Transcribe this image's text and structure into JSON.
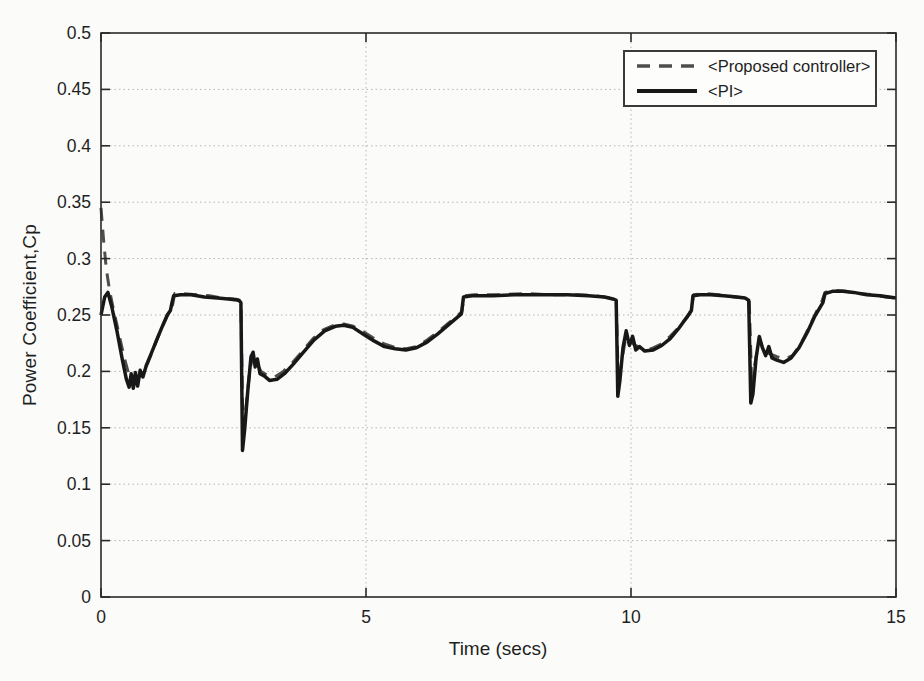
{
  "chart_data": {
    "type": "line",
    "title": "",
    "xlabel": "Time (secs)",
    "ylabel": "Power Coefficient,Cp",
    "xlim": [
      0,
      15
    ],
    "ylim": [
      0,
      0.5
    ],
    "xticks": [
      0,
      5,
      10,
      15
    ],
    "xtick_labels": [
      "0",
      "5",
      "10",
      "15"
    ],
    "yticks": [
      0,
      0.05,
      0.1,
      0.15,
      0.2,
      0.25,
      0.3,
      0.35,
      0.4,
      0.45,
      0.5
    ],
    "ytick_labels": [
      "0",
      "0.05",
      "0.1",
      "0.15",
      "0.2",
      "0.25",
      "0.3",
      "0.35",
      "0.4",
      "0.45",
      "0.5"
    ],
    "grid": true,
    "grid_style": "dotted",
    "grid_color": "#b4b4b4",
    "axis_color": "#2a2a2a",
    "legend_position": "top-right",
    "series": [
      {
        "name": "<Proposed controller>",
        "style": "dashed",
        "color": "#4d4d4d",
        "width": 3,
        "points": [
          [
            0,
            0.345
          ],
          [
            0.05,
            0.315
          ],
          [
            0.1,
            0.291
          ],
          [
            0.16,
            0.272
          ],
          [
            0.24,
            0.254
          ],
          [
            0.34,
            0.233
          ],
          [
            0.44,
            0.212
          ],
          [
            0.52,
            0.198
          ],
          [
            0.6,
            0.191
          ],
          [
            0.68,
            0.193
          ],
          [
            0.78,
            0.199
          ],
          [
            0.88,
            0.207
          ],
          [
            0.98,
            0.219
          ],
          [
            1.08,
            0.231
          ],
          [
            1.18,
            0.242
          ],
          [
            1.28,
            0.252
          ],
          [
            1.35,
            0.259
          ],
          [
            1.39,
            0.269
          ],
          [
            1.55,
            0.269
          ],
          [
            1.8,
            0.268
          ],
          [
            2.05,
            0.267
          ],
          [
            2.3,
            0.265
          ],
          [
            2.55,
            0.264
          ],
          [
            2.64,
            0.262
          ],
          [
            2.68,
            0.142
          ],
          [
            2.74,
            0.17
          ],
          [
            2.81,
            0.202
          ],
          [
            2.87,
            0.214
          ],
          [
            2.94,
            0.207
          ],
          [
            3.02,
            0.2
          ],
          [
            3.12,
            0.197
          ],
          [
            3.28,
            0.195
          ],
          [
            3.44,
            0.2
          ],
          [
            3.6,
            0.207
          ],
          [
            3.8,
            0.218
          ],
          [
            4.0,
            0.229
          ],
          [
            4.2,
            0.237
          ],
          [
            4.4,
            0.241
          ],
          [
            4.58,
            0.242
          ],
          [
            4.76,
            0.24
          ],
          [
            4.96,
            0.235
          ],
          [
            5.16,
            0.229
          ],
          [
            5.36,
            0.224
          ],
          [
            5.56,
            0.221
          ],
          [
            5.76,
            0.22
          ],
          [
            5.96,
            0.222
          ],
          [
            6.16,
            0.228
          ],
          [
            6.36,
            0.235
          ],
          [
            6.56,
            0.243
          ],
          [
            6.72,
            0.249
          ],
          [
            6.81,
            0.253
          ],
          [
            6.85,
            0.267
          ],
          [
            7.05,
            0.268
          ],
          [
            7.5,
            0.268
          ],
          [
            8.0,
            0.269
          ],
          [
            8.5,
            0.268
          ],
          [
            9.0,
            0.268
          ],
          [
            9.35,
            0.267
          ],
          [
            9.62,
            0.265
          ],
          [
            9.72,
            0.264
          ],
          [
            9.76,
            0.19
          ],
          [
            9.82,
            0.208
          ],
          [
            9.9,
            0.23
          ],
          [
            9.98,
            0.227
          ],
          [
            10.08,
            0.223
          ],
          [
            10.2,
            0.221
          ],
          [
            10.38,
            0.22
          ],
          [
            10.56,
            0.224
          ],
          [
            10.74,
            0.231
          ],
          [
            10.92,
            0.24
          ],
          [
            11.06,
            0.248
          ],
          [
            11.14,
            0.255
          ],
          [
            11.18,
            0.268
          ],
          [
            11.4,
            0.269
          ],
          [
            11.65,
            0.268
          ],
          [
            11.95,
            0.266
          ],
          [
            12.15,
            0.265
          ],
          [
            12.23,
            0.264
          ],
          [
            12.28,
            0.185
          ],
          [
            12.34,
            0.207
          ],
          [
            12.42,
            0.229
          ],
          [
            12.5,
            0.219
          ],
          [
            12.6,
            0.216
          ],
          [
            12.75,
            0.213
          ],
          [
            12.9,
            0.211
          ],
          [
            13.05,
            0.214
          ],
          [
            13.2,
            0.224
          ],
          [
            13.35,
            0.238
          ],
          [
            13.5,
            0.253
          ],
          [
            13.6,
            0.262
          ],
          [
            13.66,
            0.27
          ],
          [
            13.82,
            0.272
          ],
          [
            14.05,
            0.271
          ],
          [
            14.3,
            0.269
          ],
          [
            14.55,
            0.268
          ],
          [
            14.8,
            0.266
          ],
          [
            15.0,
            0.265
          ]
        ]
      },
      {
        "name": "<PI>",
        "style": "solid",
        "color": "#181818",
        "width": 3.5,
        "points": [
          [
            0,
            0.25
          ],
          [
            0.07,
            0.266
          ],
          [
            0.13,
            0.27
          ],
          [
            0.2,
            0.258
          ],
          [
            0.3,
            0.236
          ],
          [
            0.4,
            0.211
          ],
          [
            0.48,
            0.193
          ],
          [
            0.53,
            0.186
          ],
          [
            0.57,
            0.198
          ],
          [
            0.61,
            0.185
          ],
          [
            0.65,
            0.199
          ],
          [
            0.69,
            0.187
          ],
          [
            0.74,
            0.201
          ],
          [
            0.79,
            0.195
          ],
          [
            0.86,
            0.206
          ],
          [
            0.95,
            0.216
          ],
          [
            1.05,
            0.228
          ],
          [
            1.15,
            0.239
          ],
          [
            1.25,
            0.25
          ],
          [
            1.31,
            0.254
          ],
          [
            1.34,
            0.261
          ],
          [
            1.37,
            0.267
          ],
          [
            1.5,
            0.268
          ],
          [
            1.7,
            0.268
          ],
          [
            1.95,
            0.266
          ],
          [
            2.2,
            0.265
          ],
          [
            2.45,
            0.264
          ],
          [
            2.6,
            0.263
          ],
          [
            2.64,
            0.261
          ],
          [
            2.67,
            0.13
          ],
          [
            2.71,
            0.148
          ],
          [
            2.77,
            0.183
          ],
          [
            2.83,
            0.213
          ],
          [
            2.87,
            0.217
          ],
          [
            2.91,
            0.204
          ],
          [
            2.95,
            0.211
          ],
          [
            3.0,
            0.198
          ],
          [
            3.08,
            0.196
          ],
          [
            3.18,
            0.192
          ],
          [
            3.32,
            0.193
          ],
          [
            3.46,
            0.198
          ],
          [
            3.62,
            0.206
          ],
          [
            3.82,
            0.217
          ],
          [
            4.02,
            0.228
          ],
          [
            4.22,
            0.236
          ],
          [
            4.42,
            0.24
          ],
          [
            4.58,
            0.241
          ],
          [
            4.75,
            0.239
          ],
          [
            4.95,
            0.233
          ],
          [
            5.15,
            0.227
          ],
          [
            5.35,
            0.222
          ],
          [
            5.55,
            0.22
          ],
          [
            5.75,
            0.219
          ],
          [
            5.95,
            0.221
          ],
          [
            6.15,
            0.226
          ],
          [
            6.35,
            0.233
          ],
          [
            6.55,
            0.241
          ],
          [
            6.7,
            0.247
          ],
          [
            6.8,
            0.251
          ],
          [
            6.84,
            0.266
          ],
          [
            7.0,
            0.267
          ],
          [
            7.4,
            0.267
          ],
          [
            7.8,
            0.268
          ],
          [
            8.3,
            0.268
          ],
          [
            8.8,
            0.268
          ],
          [
            9.2,
            0.267
          ],
          [
            9.5,
            0.266
          ],
          [
            9.68,
            0.264
          ],
          [
            9.72,
            0.263
          ],
          [
            9.75,
            0.178
          ],
          [
            9.79,
            0.192
          ],
          [
            9.85,
            0.221
          ],
          [
            9.91,
            0.236
          ],
          [
            9.97,
            0.223
          ],
          [
            10.03,
            0.231
          ],
          [
            10.09,
            0.219
          ],
          [
            10.16,
            0.222
          ],
          [
            10.26,
            0.218
          ],
          [
            10.42,
            0.219
          ],
          [
            10.58,
            0.223
          ],
          [
            10.74,
            0.229
          ],
          [
            10.9,
            0.238
          ],
          [
            11.02,
            0.246
          ],
          [
            11.1,
            0.251
          ],
          [
            11.14,
            0.254
          ],
          [
            11.17,
            0.267
          ],
          [
            11.3,
            0.268
          ],
          [
            11.5,
            0.268
          ],
          [
            11.75,
            0.267
          ],
          [
            12.0,
            0.266
          ],
          [
            12.15,
            0.265
          ],
          [
            12.22,
            0.263
          ],
          [
            12.26,
            0.172
          ],
          [
            12.3,
            0.18
          ],
          [
            12.36,
            0.212
          ],
          [
            12.42,
            0.231
          ],
          [
            12.48,
            0.221
          ],
          [
            12.54,
            0.214
          ],
          [
            12.6,
            0.222
          ],
          [
            12.66,
            0.212
          ],
          [
            12.75,
            0.21
          ],
          [
            12.88,
            0.208
          ],
          [
            13.02,
            0.212
          ],
          [
            13.17,
            0.221
          ],
          [
            13.32,
            0.234
          ],
          [
            13.47,
            0.249
          ],
          [
            13.57,
            0.257
          ],
          [
            13.62,
            0.261
          ],
          [
            13.66,
            0.269
          ],
          [
            13.8,
            0.271
          ],
          [
            14.0,
            0.271
          ],
          [
            14.2,
            0.27
          ],
          [
            14.45,
            0.268
          ],
          [
            14.7,
            0.267
          ],
          [
            15.0,
            0.265
          ]
        ]
      }
    ]
  },
  "legend": {
    "items": [
      {
        "label": "<Proposed controller>"
      },
      {
        "label": "<PI>"
      }
    ]
  }
}
